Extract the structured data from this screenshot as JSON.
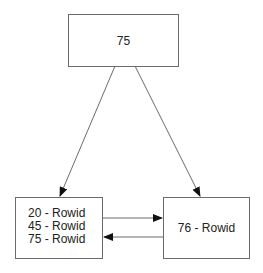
{
  "diagram": {
    "nodes": [
      {
        "id": "root",
        "label": "75"
      },
      {
        "id": "left-leaf",
        "lines": [
          "20 - Rowid",
          "45 - Rowid",
          "75 - Rowid"
        ]
      },
      {
        "id": "right-leaf",
        "label": "76 - Rowid"
      }
    ],
    "edges": [
      {
        "from": "root",
        "to": "left-leaf",
        "type": "arrow"
      },
      {
        "from": "root",
        "to": "right-leaf",
        "type": "arrow"
      },
      {
        "from": "left-leaf",
        "to": "right-leaf",
        "type": "arrow"
      },
      {
        "from": "right-leaf",
        "to": "left-leaf",
        "type": "arrow"
      }
    ],
    "colors": {
      "stroke": "#6b6b6b",
      "arrowhead": "#111111",
      "text": "#222222"
    }
  }
}
